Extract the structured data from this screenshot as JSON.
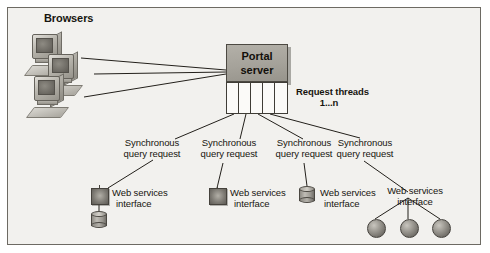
{
  "figure": {
    "background_color": "#f2f1ee",
    "border_color": "#6d6a63"
  },
  "labels": {
    "browsers": "Browsers",
    "request_threads_line1": "Request threads",
    "request_threads_line2": "1...n"
  },
  "portal": {
    "line1": "Portal",
    "line2": "server",
    "fill_color": "#a5a29a"
  },
  "threads": {
    "count": 4,
    "divider_count": 5
  },
  "browsers": [
    {
      "name": "browser-1"
    },
    {
      "name": "browser-2"
    },
    {
      "name": "browser-3"
    }
  ],
  "branches": [
    {
      "request_label_line1": "Synchronous",
      "request_label_line2": "query request",
      "service_label_line1": "Web services",
      "service_label_line2": "interface",
      "icon": "web-service-square-icon",
      "backend": "database-cylinder-icon"
    },
    {
      "request_label_line1": "Synchronous",
      "request_label_line2": "query request",
      "service_label_line1": "Web services",
      "service_label_line2": "interface",
      "icon": "web-service-square-icon",
      "backend": "none"
    },
    {
      "request_label_line1": "Synchronous",
      "request_label_line2": "query request",
      "service_label_line1": "Web services",
      "service_label_line2": "interface",
      "icon": "database-cylinder-icon",
      "backend": "none"
    },
    {
      "request_label_line1": "Synchronous",
      "request_label_line2": "query request",
      "service_label_line1": "Web services",
      "service_label_line2": "interface",
      "icon": "none",
      "backend": "three-spheres"
    }
  ],
  "spheres": [
    {
      "name": "resource-node-1"
    },
    {
      "name": "resource-node-2"
    },
    {
      "name": "resource-node-3"
    }
  ]
}
